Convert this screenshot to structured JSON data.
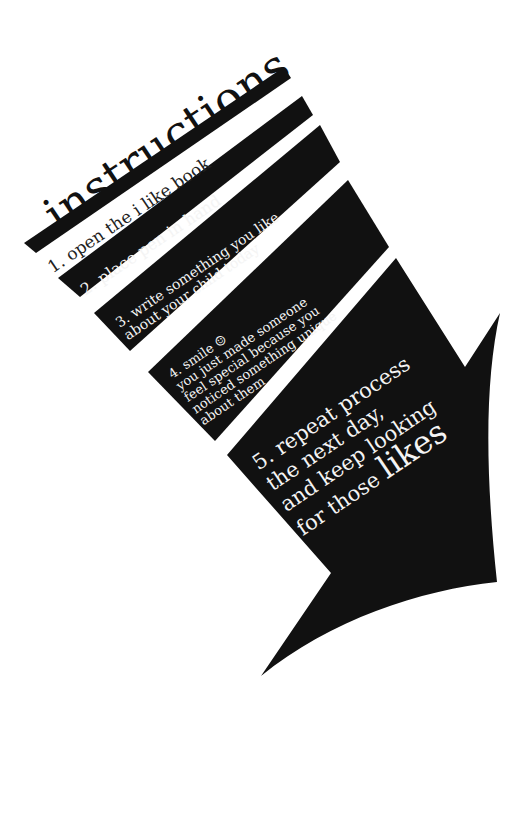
{
  "title": "instructions",
  "colors": {
    "ink": "#111111",
    "paper": "#ffffff",
    "reverse_text": "#f4f4f4"
  },
  "rotation_deg": -34,
  "steps": [
    {
      "number": "1.",
      "lines": [
        "1. open the i like book"
      ]
    },
    {
      "number": "2.",
      "lines": [
        "2. place pen in hand"
      ]
    },
    {
      "number": "3.",
      "lines": [
        "3. write something you like",
        "about your child today"
      ]
    },
    {
      "number": "4.",
      "lines": [
        "4. smile ☺",
        "you just made someone",
        "feel special because you",
        "noticed something unique",
        "about them"
      ]
    },
    {
      "number": "5.",
      "lines": [
        "5. repeat process",
        "the next day,",
        "and keep looking"
      ],
      "last_line_prefix": "for those ",
      "emphasis": "likes"
    }
  ],
  "shapes": {
    "bar_1": "24,243 284,67 291,78 36,253",
    "bar_2": "58,278 302,96 313,115 80,297",
    "bar_3": "94,313 320,125 340,162 130,351",
    "bar_4": "148,372 348,180 389,247 215,441",
    "arrow": "M227,455 L396,258 L465,367 L500,313 C485,380 485,470 497,582 C420,590 330,620 261,676 L331,573 Z"
  }
}
